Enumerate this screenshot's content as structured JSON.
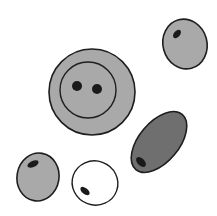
{
  "diagram": {
    "colors": {
      "background": "#ffffff",
      "outline": "#1e1e1e",
      "light_fill": "#a9a9a9",
      "dark_fill": "#6f6f6f",
      "empty_fill": "#ffffff",
      "nucleus": "#1a1a1a"
    },
    "cells": [
      {
        "name": "large-binucleate-cell",
        "fill": "light_fill",
        "has_inner_membrane": true,
        "nuclei_count": 2
      },
      {
        "name": "top-right-cell",
        "fill": "light_fill",
        "nuclei_count": 1
      },
      {
        "name": "dark-elongated-cell",
        "fill": "dark_fill",
        "nuclei_count": 1
      },
      {
        "name": "bottom-left-cell",
        "fill": "light_fill",
        "nuclei_count": 1
      },
      {
        "name": "empty-cell",
        "fill": "empty_fill",
        "nuclei_count": 1
      }
    ]
  }
}
